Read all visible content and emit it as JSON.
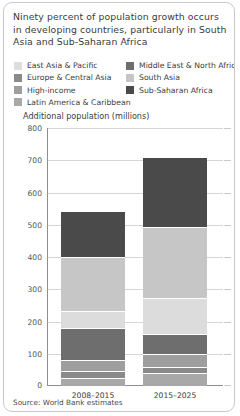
{
  "panel": {
    "title": "Ninety percent of population growth occurs in developing countries, particularly in South Asia and Sub-Saharan Africa",
    "source": "Source: World Bank estimates",
    "axis_label": "Additional population (millions)"
  },
  "legend": {
    "left": [
      {
        "label": "East Asia & Pacific",
        "color": "#dcdcdc"
      },
      {
        "label": "Europe & Central Asia",
        "color": "#8a8a8a"
      },
      {
        "label": "High-income",
        "color": "#9e9e9e"
      },
      {
        "label": "Latin America & Caribbean",
        "color": "#a8a8a8"
      }
    ],
    "right": [
      {
        "label": "Middle East & North Africa",
        "color": "#6e6e6e"
      },
      {
        "label": "South Asia",
        "color": "#c6c6c6"
      },
      {
        "label": "Sub-Saharan Africa",
        "color": "#4a4a4a"
      }
    ]
  },
  "chart_data": {
    "type": "bar",
    "stacked": true,
    "title": "Ninety percent of population growth occurs in developing countries, particularly in South Asia and Sub-Saharan Africa",
    "xlabel": "",
    "ylabel": "Additional population (millions)",
    "ylim": [
      0,
      800
    ],
    "yticks": [
      0,
      100,
      200,
      300,
      400,
      500,
      600,
      700,
      800
    ],
    "ytick_labels": [
      "0",
      "100",
      "200",
      "300",
      "400",
      "500",
      "600",
      "700",
      "800"
    ],
    "grid": true,
    "legend_position": "top",
    "categories": [
      "2008–2015",
      "2015–2025"
    ],
    "series": [
      {
        "name": "Latin America & Caribbean",
        "color": "#a8a8a8",
        "values": [
          25,
          40
        ]
      },
      {
        "name": "Europe & Central Asia",
        "color": "#8a8a8a",
        "values": [
          22,
          20
        ]
      },
      {
        "name": "High-income",
        "color": "#9e9e9e",
        "values": [
          35,
          40
        ]
      },
      {
        "name": "Middle East & North Africa",
        "color": "#6e6e6e",
        "values": [
          98,
          60
        ]
      },
      {
        "name": "East Asia & Pacific",
        "color": "#dcdcdc",
        "values": [
          52,
          112
        ]
      },
      {
        "name": "South Asia",
        "color": "#c6c6c6",
        "values": [
          168,
          220
        ]
      },
      {
        "name": "Sub-Saharan Africa",
        "color": "#4a4a4a",
        "values": [
          143,
          218
        ]
      }
    ],
    "totals": [
      543,
      710
    ]
  }
}
